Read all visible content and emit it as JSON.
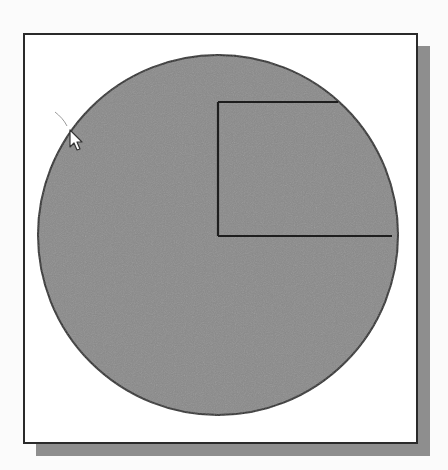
{
  "diagram": {
    "canvas": {
      "background": "#ffffff",
      "border": "#2a2a2a",
      "shadow": "#8e8e8e"
    },
    "circle": {
      "cx": 218,
      "cy": 235,
      "r": 180,
      "fill": "#8a8a8a",
      "stroke": "#2a2a2a"
    },
    "rectangle": {
      "left_x": 218,
      "top_y": 102,
      "bottom_y": 236,
      "top_edge_end_x": 338,
      "bottom_edge_end_x": 392,
      "stroke": "#1e1e1e"
    },
    "cursor": {
      "type": "arrow-pointer",
      "x": 70,
      "y": 130
    }
  }
}
